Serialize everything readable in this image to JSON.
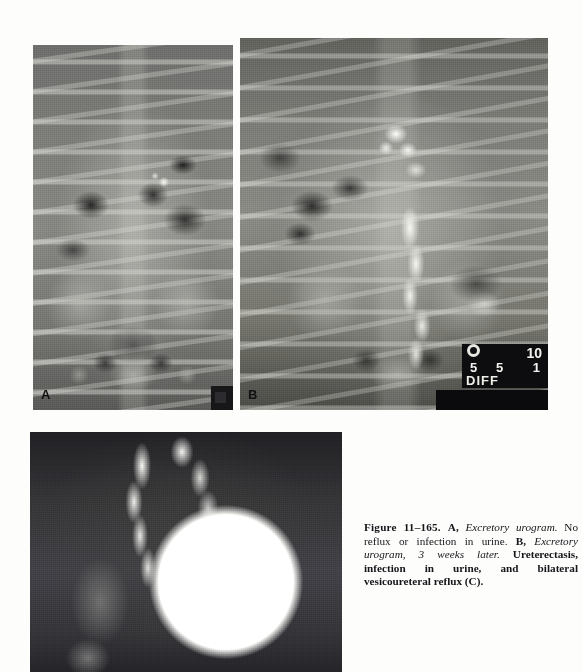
{
  "figure": {
    "number": "Figure 11–165.",
    "caption_segments": {
      "panel_a_letter": "A,",
      "panel_a_italic": "Excretory urogram.",
      "panel_a_text": "No reflux or infection in urine.",
      "panel_b_letter": "B,",
      "panel_b_italic": "Excretory urogram, 3 weeks later.",
      "panel_b_text": "Ureterectasis, infection in urine, and bilateral vesicoureteral reflux (C)."
    },
    "caption_full": "Figure 11–165. A, Excretory urogram. No reflux or infection in urine. B, Excretory urogram, 3 weeks later. Ureterectasis, infection in urine, and bilateral vesicoureteral reflux (C)."
  },
  "panels": [
    {
      "id": "a",
      "label": "A",
      "modality": "Excretory urogram",
      "description": "Anteroposterior abdominal radiograph showing normal collecting systems, lumbar spine, ribs and bony pelvis"
    },
    {
      "id": "b",
      "label": "B",
      "modality": "Excretory urogram, 3 weeks later",
      "description": "Anteroposterior abdominal radiograph showing dilated contrast-filled ureters (ureterectasis)"
    },
    {
      "id": "c",
      "label": "",
      "modality": "Voiding cystourethrogram",
      "description": "Contrast-opacified bladder with bilateral refluxing dilated ureters"
    }
  ],
  "markers": {
    "ruler_labels": {
      "ten": "10",
      "five_left": "5",
      "five_right": "5",
      "one": "1",
      "word": "DIFF"
    }
  },
  "colors": {
    "page_background": "#fdfdfc",
    "caption_text": "#15151a",
    "film_mid_gray": "#8a8a86",
    "contrast_white": "#fdfdfa",
    "marker_black": "#0d0d10"
  }
}
